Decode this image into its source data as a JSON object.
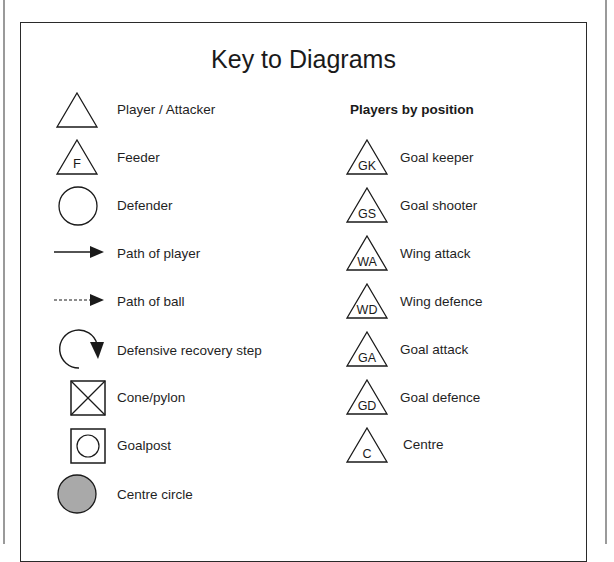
{
  "document": {
    "title": "Key to Diagrams",
    "left_column": {
      "items": [
        {
          "icon": "triangle-icon",
          "label": "Player / Attacker"
        },
        {
          "icon": "triangle-f-icon",
          "letter": "F",
          "label": "Feeder"
        },
        {
          "icon": "circle-icon",
          "label": "Defender"
        },
        {
          "icon": "solid-arrow-icon",
          "label": "Path of player"
        },
        {
          "icon": "dashed-arrow-icon",
          "label": "Path of ball"
        },
        {
          "icon": "curved-arrow-icon",
          "label": "Defensive recovery step"
        },
        {
          "icon": "crossed-box-icon",
          "label": "Cone/pylon"
        },
        {
          "icon": "boxed-circle-icon",
          "label": "Goalpost"
        },
        {
          "icon": "filled-circle-icon",
          "label": "Centre circle",
          "fill": "#a9a9a9"
        }
      ]
    },
    "right_column": {
      "heading": "Players by position",
      "items": [
        {
          "abbr": "GK",
          "label": "Goal keeper"
        },
        {
          "abbr": "GS",
          "label": "Goal shooter"
        },
        {
          "abbr": "WA",
          "label": "Wing attack"
        },
        {
          "abbr": "WD",
          "label": "Wing defence"
        },
        {
          "abbr": "GA",
          "label": "Goal attack"
        },
        {
          "abbr": "GD",
          "label": "Goal defence"
        },
        {
          "abbr": "C",
          "label": "Centre"
        }
      ]
    }
  },
  "colors": {
    "stroke": "#1a1a1a",
    "centre_circle_fill": "#a9a9a9",
    "frame": "#9a9a9a"
  }
}
